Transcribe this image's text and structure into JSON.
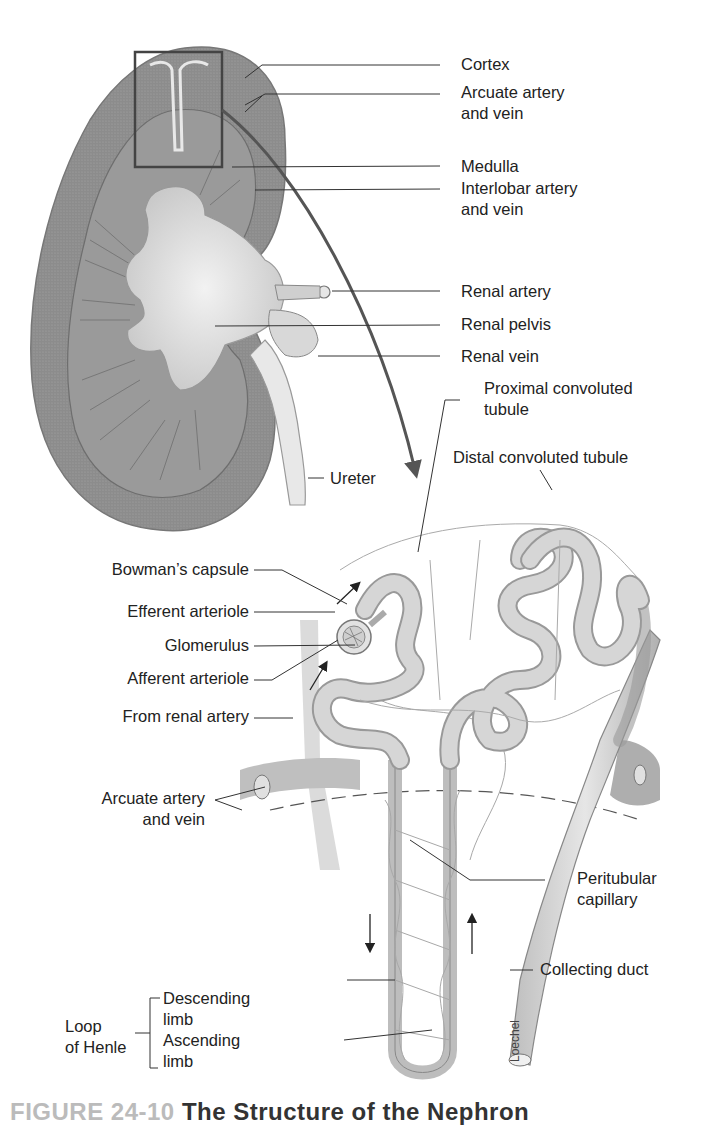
{
  "figure": {
    "caption_number": "FIGURE 24-10",
    "caption_title": "The Structure of the Nephron",
    "artist_signature": "Loechel"
  },
  "kidney_labels": {
    "cortex": "Cortex",
    "arcuate_line1": "Arcuate artery",
    "arcuate_line2": "and vein",
    "medulla": "Medulla",
    "interlobar_line1": "Interlobar artery",
    "interlobar_line2": "and vein",
    "renal_artery": "Renal artery",
    "renal_pelvis": "Renal pelvis",
    "renal_vein": "Renal vein",
    "ureter": "Ureter"
  },
  "nephron_labels": {
    "proximal_line1": "Proximal convoluted",
    "proximal_line2": "tubule",
    "distal": "Distal convoluted tubule",
    "bowmans_capsule": "Bowman’s capsule",
    "efferent_arteriole": "Efferent arteriole",
    "glomerulus": "Glomerulus",
    "afferent_arteriole": "Afferent arteriole",
    "from_renal_artery": "From renal artery",
    "arcuate_line1": "Arcuate artery",
    "arcuate_line2": "and vein",
    "peritubular_line1": "Peritubular",
    "peritubular_line2": "capillary",
    "collecting_duct": "Collecting duct",
    "loop_line1": "Loop",
    "loop_line2": "of Henle",
    "descending_line1": "Descending",
    "descending_line2": "limb",
    "ascending_line1": "Ascending",
    "ascending_line2": "limb"
  },
  "colors": {
    "kidney_cortex": "#8a8a8a",
    "kidney_medulla": "#9d9d9d",
    "pelvis": "#dcdcdc",
    "tubule": "#c8c8c8",
    "leader_line": "#333333",
    "arrow": "#555555"
  }
}
